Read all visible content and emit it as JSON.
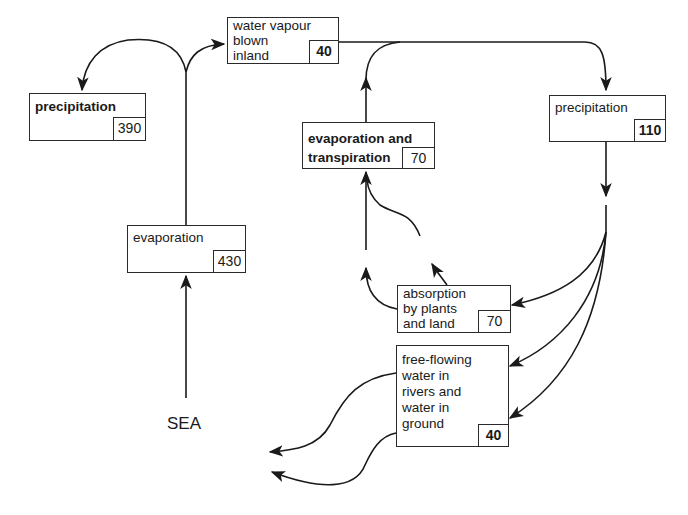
{
  "diagram": {
    "nodes": {
      "precipitation_sea": {
        "label": "precipitation",
        "value": "390"
      },
      "evaporation_sea": {
        "label": "evaporation",
        "value": "430"
      },
      "water_vapour": {
        "label": "water vapour\nblown\ninland",
        "value": "40"
      },
      "evapotranspiration": {
        "label": "evaporation and\ntranspiration",
        "value": "70"
      },
      "precipitation_land": {
        "label": "precipitation",
        "value": "110"
      },
      "absorption": {
        "label": "absorption\nby plants\nand  land",
        "value": "70"
      },
      "free_flowing": {
        "label": "free-flowing\nwater in\nrivers and\nwater in\nground",
        "value": "40"
      },
      "sea": {
        "label": "SEA"
      }
    },
    "edges": [
      {
        "from": "SEA",
        "to": "evaporation"
      },
      {
        "from": "evaporation",
        "to": "precipitation (390)"
      },
      {
        "from": "evaporation",
        "to": "water vapour blown inland"
      },
      {
        "from": "water vapour blown inland",
        "to": "precipitation (110)"
      },
      {
        "from": "evaporation and transpiration",
        "to": "water vapour blown inland"
      },
      {
        "from": "precipitation (110)",
        "to": "absorption by plants and land"
      },
      {
        "from": "precipitation (110)",
        "to": "free-flowing water"
      },
      {
        "from": "absorption by plants and land",
        "to": "evaporation and transpiration"
      },
      {
        "from": "free-flowing water",
        "to": "SEA"
      }
    ]
  }
}
